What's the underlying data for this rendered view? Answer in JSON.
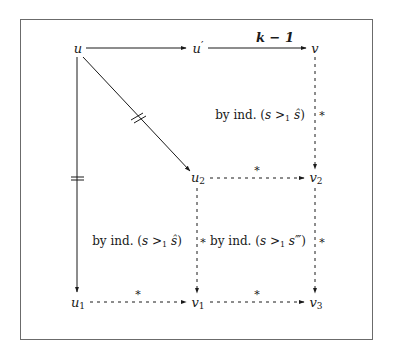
{
  "diagram": {
    "nodes": {
      "u": {
        "label": "u",
        "sub": "",
        "prime": ""
      },
      "u_prime": {
        "label": "u",
        "sub": "",
        "prime": "′"
      },
      "v": {
        "label": "v",
        "sub": "",
        "prime": ""
      },
      "u2": {
        "label": "u",
        "sub": "2",
        "prime": ""
      },
      "v2": {
        "label": "v",
        "sub": "2",
        "prime": ""
      },
      "u1": {
        "label": "u",
        "sub": "1",
        "prime": ""
      },
      "v1": {
        "label": "v",
        "sub": "1",
        "prime": ""
      },
      "v3": {
        "label": "v",
        "sub": "3",
        "prime": ""
      }
    },
    "edges": [
      {
        "from": "u",
        "to": "u'",
        "style": "solid",
        "label": ""
      },
      {
        "from": "u'",
        "to": "v",
        "style": "solid",
        "label": "k − 1"
      },
      {
        "from": "u",
        "to": "u2",
        "style": "solid",
        "label": "",
        "marker": "parallel-bars"
      },
      {
        "from": "u",
        "to": "u1",
        "style": "solid",
        "label": "",
        "marker": "parallel-bars"
      },
      {
        "from": "v",
        "to": "v2",
        "style": "dashed",
        "label": "*"
      },
      {
        "from": "u2",
        "to": "v2",
        "style": "dashed",
        "label": "*"
      },
      {
        "from": "u2",
        "to": "v1",
        "style": "dashed",
        "label": "*"
      },
      {
        "from": "v2",
        "to": "v3",
        "style": "dashed",
        "label": "*"
      },
      {
        "from": "u1",
        "to": "v1",
        "style": "dashed",
        "label": "*"
      },
      {
        "from": "v1",
        "to": "v3",
        "style": "dashed",
        "label": "*"
      }
    ],
    "edge_labels": {
      "k_minus_1": "k − 1",
      "star": "*"
    },
    "regions": {
      "top_right": {
        "prefix": "by ind. (",
        "lhs": "s",
        "rel": ">",
        "rel_sub": "1",
        "rhs": "ŝ",
        "suffix": ")"
      },
      "bottom_left": {
        "prefix": "by ind. (",
        "lhs": "s",
        "rel": ">",
        "rel_sub": "1",
        "rhs": "ŝ",
        "suffix": ")"
      },
      "bottom_right": {
        "prefix": "by ind. (",
        "lhs": "s",
        "rel": ">",
        "rel_sub": "1",
        "rhs": "s‴",
        "suffix": ")"
      }
    },
    "colors": {
      "stroke": "#1a1a1a",
      "frame": "#6b6b6b",
      "background": "#ffffff"
    }
  }
}
